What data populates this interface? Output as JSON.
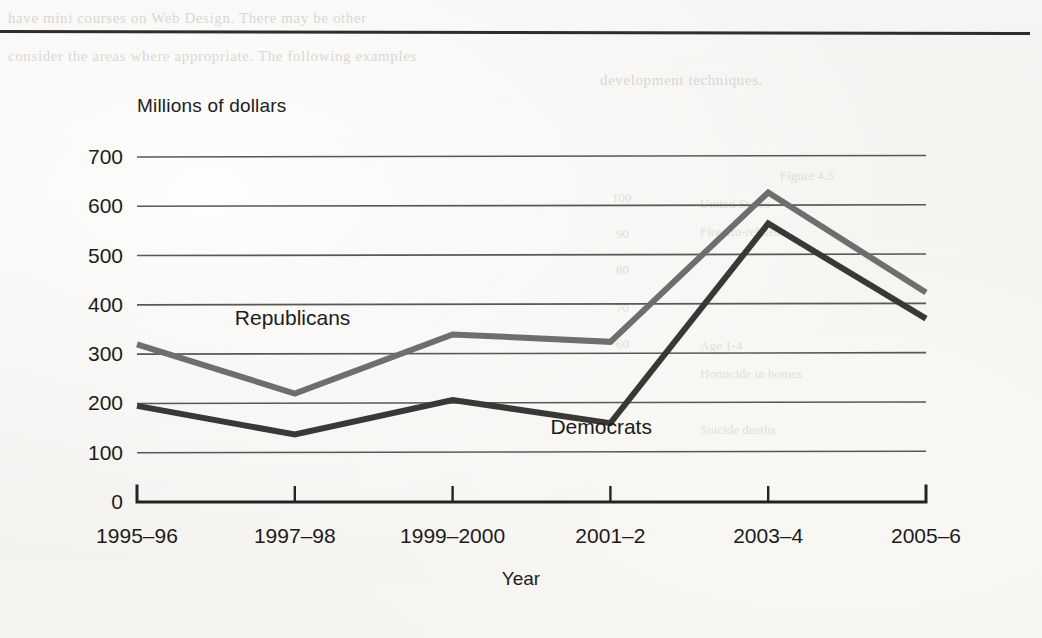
{
  "page": {
    "background_color": "#f3f2f0",
    "rule_color": "#2e2e2e",
    "ghost_text_left": [
      "have mini courses on Web Design. There may be other",
      "consider the areas where appropriate. The following examples"
    ],
    "ghost_text_right": [
      "development techniques.",
      "Figure 4.3",
      "United States",
      "Firearm-related",
      "Age 1-4",
      "Homicide in homes",
      "Suicide deaths",
      "100",
      "90",
      "80",
      "70",
      "60"
    ]
  },
  "chart_data": {
    "type": "line",
    "title": "",
    "subtitle": "",
    "xlabel": "Year",
    "ylabel": "Millions of dollars",
    "categories": [
      "1995–96",
      "1997–98",
      "1999–2000",
      "2001–2",
      "2003–4",
      "2005–6"
    ],
    "yticks": [
      0,
      100,
      200,
      300,
      400,
      500,
      600,
      700
    ],
    "ylim": [
      0,
      700
    ],
    "grid": "horizontal",
    "legend": "inline-labels",
    "series": [
      {
        "name": "Republicans",
        "color": "#6e6e6e",
        "values": [
          320,
          220,
          340,
          325,
          628,
          425
        ]
      },
      {
        "name": "Democrats",
        "color": "#3a3836",
        "values": [
          195,
          137,
          207,
          160,
          565,
          372
        ]
      }
    ],
    "annotations": [
      {
        "text": "Republicans",
        "x_category": "1997–98",
        "value": 370
      },
      {
        "text": "Democrats",
        "x_category": "2001–2",
        "value": 148
      }
    ]
  }
}
